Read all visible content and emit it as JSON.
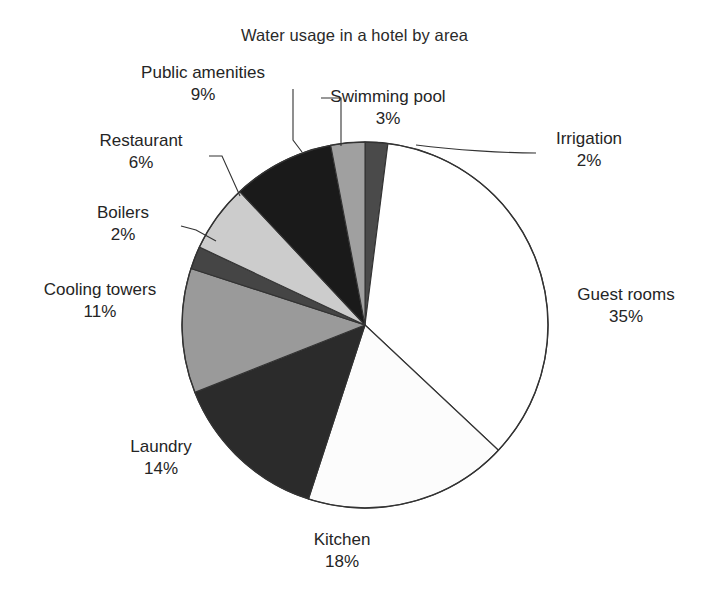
{
  "chart_data": {
    "type": "pie",
    "title": "Water usage in a hotel by area",
    "unit": "%",
    "total": 100,
    "start_angle_deg": 0,
    "direction": "clockwise",
    "center": {
      "x": 365,
      "y": 325
    },
    "radius": 183,
    "legend": "none (direct labels with leader lines)",
    "categories": [
      "Irrigation",
      "Guest rooms",
      "Kitchen",
      "Laundry",
      "Cooling towers",
      "Boilers",
      "Restaurant",
      "Public amenities",
      "Swimming pool"
    ],
    "values": [
      2,
      35,
      18,
      14,
      11,
      2,
      6,
      9,
      3
    ],
    "slices": [
      {
        "name": "Irrigation",
        "value": 2,
        "pct_text": "2%",
        "color": "#4a4a4a",
        "label_name": "Irrigation",
        "label_pct": "2%"
      },
      {
        "name": "Guest rooms",
        "value": 35,
        "pct_text": "35%",
        "color": "#ffffff",
        "label_name": "Guest rooms",
        "label_pct": "35%"
      },
      {
        "name": "Kitchen",
        "value": 18,
        "pct_text": "18%",
        "color": "#fcfcfc",
        "label_name": "Kitchen",
        "label_pct": "18%"
      },
      {
        "name": "Laundry",
        "value": 14,
        "pct_text": "14%",
        "color": "#2b2b2b",
        "label_name": "Laundry",
        "label_pct": "14%"
      },
      {
        "name": "Cooling towers",
        "value": 11,
        "pct_text": "11%",
        "color": "#9a9a9a",
        "label_name": "Cooling towers",
        "label_pct": "11%"
      },
      {
        "name": "Boilers",
        "value": 2,
        "pct_text": "2%",
        "color": "#454545",
        "label_name": "Boilers",
        "label_pct": "2%"
      },
      {
        "name": "Restaurant",
        "value": 6,
        "pct_text": "6%",
        "color": "#cccccc",
        "label_name": "Restaurant",
        "label_pct": "6%"
      },
      {
        "name": "Public amenities",
        "value": 9,
        "pct_text": "9%",
        "color": "#1a1a1a",
        "label_name": "Public amenities",
        "label_pct": "9%"
      },
      {
        "name": "Swimming pool",
        "value": 3,
        "pct_text": "3%",
        "color": "#a0a0a0",
        "label_name": "Swimming pool",
        "label_pct": "3%"
      }
    ],
    "colors": {
      "outline": "#333333",
      "leader_line": "#333333",
      "text": "#252525",
      "background": "#ffffff"
    }
  }
}
